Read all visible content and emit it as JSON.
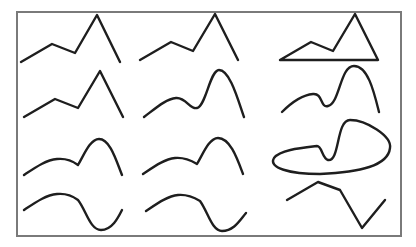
{
  "figure": {
    "colors": {
      "background": "#ffffff",
      "frame": "#7a7a7a",
      "stroke": "#1e1e1e"
    },
    "frame": {
      "x": 17,
      "y": 12,
      "width": 384,
      "height": 224
    },
    "rows": [
      {
        "name": "row-1",
        "cells": [
          {
            "name": "polyline-sharp",
            "d": "M21,62 L52,44 L75,53 L97,15 L120,62"
          },
          {
            "name": "polyline-sharp",
            "d": "M140,60 L171,42 L193,51 L215,14 L238,60"
          },
          {
            "name": "closed-polygon",
            "d": "M280,60 L311,42 L333,51 L355,14 L378,60 Z"
          }
        ]
      },
      {
        "name": "row-2",
        "cells": [
          {
            "name": "polyline-sharp",
            "d": "M24,117 L55,99 L78,108 L100,71 L123,117"
          },
          {
            "name": "smooth-curve",
            "d": "M144,117 C156,108 166,99 176,98 C186,97 190,110 197,108 C206,106 210,70 219,70 C230,70 238,100 244,117"
          },
          {
            "name": "smooth-curve",
            "d": "M282,112 C292,102 302,95 313,94 C323,93 320,108 328,106 C340,103 340,66 354,66 C368,66 374,92 379,112"
          }
        ]
      },
      {
        "name": "row-3",
        "cells": [
          {
            "name": "smooth-kink-curve",
            "d": "M24,175 C36,167 46,160 57,159 C67,158 74,162 78,165 C84,155 90,139 99,139 C110,139 116,160 122,175"
          },
          {
            "name": "smooth-kink-curve",
            "d": "M143,174 C155,166 165,159 175,158 C185,157 192,161 197,164 C203,154 209,138 218,138 C230,138 237,158 243,174"
          },
          {
            "name": "closed-blob",
            "d": "M274,158 C280,150 300,148 317,146 C322,146 322,158 328,160 C340,162 336,120 350,120 C366,120 392,136 390,148 C388,166 360,172 320,174 C290,174 268,168 274,158 Z"
          }
        ]
      },
      {
        "name": "row-4",
        "cells": [
          {
            "name": "wave-curve",
            "d": "M24,210 C36,202 46,195 57,194 C67,193 74,197 78,200 C86,210 90,230 101,230 C112,230 118,218 122,210"
          },
          {
            "name": "wave-curve",
            "d": "M146,211 C158,203 168,196 178,195 C188,194 195,198 200,201 C208,212 212,231 222,231 C234,231 240,220 246,213"
          },
          {
            "name": "polyline-sharp",
            "d": "M287,200 L318,182 L340,190 L362,228 L385,200"
          }
        ]
      }
    ]
  }
}
